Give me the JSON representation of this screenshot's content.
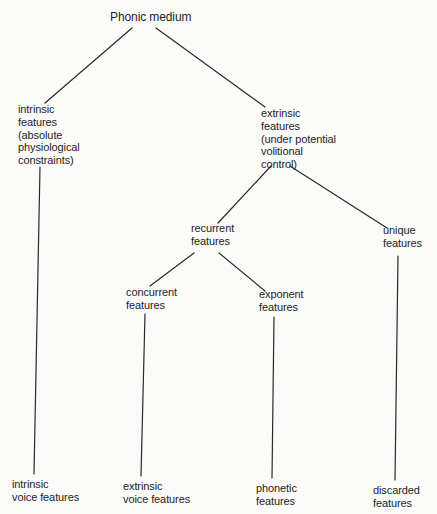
{
  "diagram": {
    "type": "tree",
    "title": "Phonic medium",
    "nodes": {
      "root": {
        "lines": [
          "Phonic medium"
        ],
        "x": 110,
        "y": 11
      },
      "intrinsic": {
        "lines": [
          "intrinsic",
          "features",
          "(absolute",
          "physiological",
          "constraints)"
        ],
        "x": 18,
        "y": 103
      },
      "extrinsic": {
        "lines": [
          "extrinsic",
          "features",
          "(under potential",
          "volitional",
          "control)"
        ],
        "x": 261,
        "y": 107
      },
      "recurrent": {
        "lines": [
          "recurrent",
          "features"
        ],
        "x": 191,
        "y": 222
      },
      "unique": {
        "lines": [
          "unique",
          "features"
        ],
        "x": 383,
        "y": 224
      },
      "concurrent": {
        "lines": [
          "concurrent",
          "features"
        ],
        "x": 126,
        "y": 286
      },
      "exponent": {
        "lines": [
          "exponent",
          "features"
        ],
        "x": 259,
        "y": 288
      },
      "intrinsic_voice": {
        "lines": [
          "intrinsic",
          "voice features"
        ],
        "x": 12,
        "y": 478
      },
      "extrinsic_voice": {
        "lines": [
          "extrinsic",
          "voice features"
        ],
        "x": 123,
        "y": 480
      },
      "phonetic": {
        "lines": [
          "phonetic",
          "features"
        ],
        "x": 256,
        "y": 482
      },
      "discarded": {
        "lines": [
          "discarded",
          "features"
        ],
        "x": 373,
        "y": 484
      }
    },
    "edges": [
      {
        "from": "root",
        "to": "intrinsic",
        "x1": 132,
        "y1": 28,
        "x2": 45,
        "y2": 103
      },
      {
        "from": "root",
        "to": "extrinsic",
        "x1": 156,
        "y1": 28,
        "x2": 265,
        "y2": 107
      },
      {
        "from": "extrinsic",
        "to": "recurrent",
        "x1": 271,
        "y1": 166,
        "x2": 218,
        "y2": 223
      },
      {
        "from": "extrinsic",
        "to": "unique",
        "x1": 290,
        "y1": 166,
        "x2": 387,
        "y2": 228
      },
      {
        "from": "recurrent",
        "to": "concurrent",
        "x1": 194,
        "y1": 253,
        "x2": 150,
        "y2": 286
      },
      {
        "from": "recurrent",
        "to": "exponent",
        "x1": 219,
        "y1": 253,
        "x2": 265,
        "y2": 291
      },
      {
        "from": "intrinsic",
        "to": "intrinsic_voice",
        "x1": 40,
        "y1": 167,
        "x2": 34,
        "y2": 474
      },
      {
        "from": "concurrent",
        "to": "extrinsic_voice",
        "x1": 145,
        "y1": 314,
        "x2": 141,
        "y2": 476
      },
      {
        "from": "exponent",
        "to": "phonetic",
        "x1": 274,
        "y1": 317,
        "x2": 272,
        "y2": 478
      },
      {
        "from": "unique",
        "to": "discarded",
        "x1": 398,
        "y1": 256,
        "x2": 395,
        "y2": 480
      }
    ],
    "colors": {
      "background": "#fbfbfa",
      "text": "#1e1e1e",
      "line": "#2a2a2a"
    }
  }
}
